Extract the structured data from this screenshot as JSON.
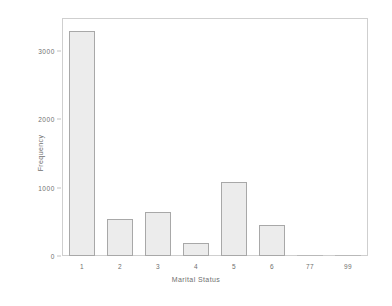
{
  "chart_data": {
    "type": "bar",
    "title": "",
    "xlabel": "Marital Status",
    "ylabel": "Frequency",
    "categories": [
      "1",
      "2",
      "3",
      "4",
      "5",
      "6",
      "77",
      "99"
    ],
    "values": [
      3130,
      520,
      615,
      180,
      1035,
      430,
      0,
      0
    ],
    "series": [
      {
        "name": "Frequency",
        "values": [
          3130,
          520,
          615,
          180,
          1035,
          430,
          0,
          0
        ]
      }
    ],
    "ylim": [
      0,
      3300
    ],
    "xlim": [
      0.5,
      8.5
    ],
    "yticks": [
      0,
      1000,
      2000,
      3000
    ],
    "ytick_labels": [
      "0",
      "1000",
      "2000",
      "3000"
    ],
    "xtick_labels": [
      "1",
      "2",
      "3",
      "4",
      "5",
      "6",
      "77",
      "99"
    ],
    "grid": false,
    "legend": null,
    "legend_position": "none",
    "bar_fill_color": "#ececec",
    "bar_edge_color": "#a8a8a8",
    "frame_color": "#cfcfcf",
    "text_color": "#6f6f6f",
    "background_color": "#ffffff"
  }
}
